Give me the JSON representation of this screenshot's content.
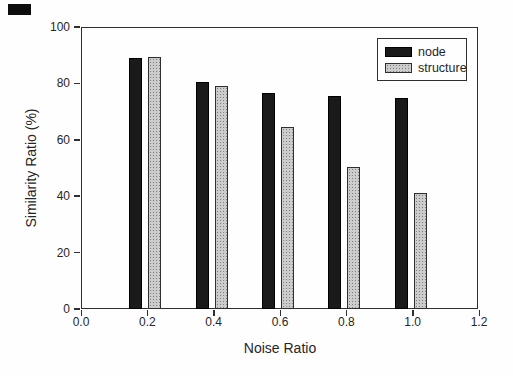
{
  "page": {
    "corner_mark_color": "#0d0d0d",
    "background_color": "#fefefe"
  },
  "chart_data": {
    "type": "bar",
    "title": "",
    "xlabel": "Noise Ratio",
    "ylabel": "Similarity Ratio (%)",
    "xlim": [
      0.0,
      1.2
    ],
    "ylim": [
      0,
      100
    ],
    "xticks": [
      "0.0",
      "0.2",
      "0.4",
      "0.6",
      "0.8",
      "1.0",
      "1.2"
    ],
    "yticks": [
      0,
      20,
      40,
      60,
      80,
      100
    ],
    "categories": [
      0.2,
      0.4,
      0.6,
      0.8,
      1.0
    ],
    "series": [
      {
        "name": "node",
        "fill": "solid",
        "color": "#1a1a1a",
        "values": [
          89,
          80.5,
          76.5,
          75.5,
          75
        ]
      },
      {
        "name": "structure",
        "fill": "stipple",
        "color": "#cccccc",
        "dot_color": "#7f7f7f",
        "values": [
          89.5,
          79,
          64.5,
          50.5,
          41
        ]
      }
    ],
    "legend": {
      "position": "upper-right",
      "entries": [
        "node",
        "structure"
      ]
    },
    "grid": false,
    "frame": true,
    "axis_color": "#2f2f2f",
    "text_color": "#262626"
  }
}
